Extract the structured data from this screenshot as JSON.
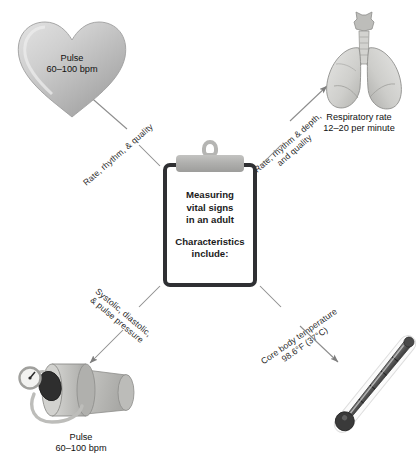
{
  "diagram": {
    "title": "Measuring vital signs in an adult",
    "center": {
      "line1": "Measuring",
      "line2": "vital signs",
      "line3": "in an adult",
      "line4": "Characteristics",
      "line5": "include:"
    },
    "branches": [
      {
        "id": "pulse-heart",
        "icon": "heart-icon",
        "connector_label": "Rate, rhythm, & quality",
        "caption_line1": "Pulse",
        "caption_line2": "60–100 bpm",
        "position": "top-left"
      },
      {
        "id": "respiration-lungs",
        "icon": "lungs-icon",
        "connector_label_line1": "Rate, rhythm & depth,",
        "connector_label_line2": "and quality",
        "caption_line1": "Respiratory rate",
        "caption_line2": "12–20 per minute",
        "position": "top-right"
      },
      {
        "id": "blood-pressure-cuff",
        "icon": "sphygmomanometer-icon",
        "connector_label_line1": "Systolic, diastolic,",
        "connector_label_line2": "& pulse pressure",
        "caption_line1": "Pulse",
        "caption_line2": "60–100 bpm",
        "position": "bottom-left"
      },
      {
        "id": "temperature-thermometer",
        "icon": "thermometer-icon",
        "connector_label_line1": "Core body temperature",
        "connector_label_line2": "98.6°F (37°C)",
        "position": "bottom-right"
      }
    ],
    "colors": {
      "background": "#ffffff",
      "clipboard_border": "#2f3033",
      "clip_metal": "#b5b5b3",
      "organ_gray_light": "#dcdcdc",
      "organ_gray_mid": "#bdbdbd",
      "organ_gray_dark": "#9a9a9a",
      "connector_line": "#8c8c8c",
      "text": "#1a1a1a"
    }
  }
}
